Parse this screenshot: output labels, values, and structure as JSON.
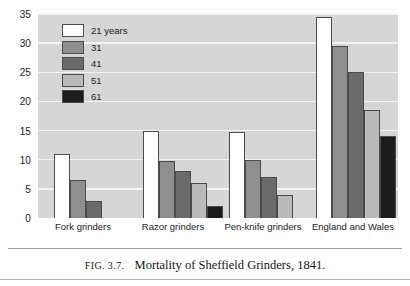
{
  "caption": {
    "figure_number": "FIG. 3.7.",
    "text": "Mortality of Sheffield Grinders, 1841."
  },
  "chart_data": {
    "type": "bar",
    "title": "Mortality of Sheffield Grinders, 1841.",
    "xlabel": "",
    "ylabel": "",
    "ylim": [
      0,
      35
    ],
    "yticks": [
      0,
      5,
      10,
      15,
      20,
      25,
      30,
      35
    ],
    "grid": true,
    "legend_position": "top-left inside plot",
    "categories": [
      "Fork grinders",
      "Razor grinders",
      "Pen-knife grinders",
      "England and Wales"
    ],
    "series": [
      {
        "name": "21 years",
        "color": "#ffffff",
        "values": [
          11,
          15,
          14.7,
          34.5
        ]
      },
      {
        "name": "31",
        "color": "#8f8f8f",
        "values": [
          6.5,
          9.7,
          10,
          29.5
        ]
      },
      {
        "name": "41",
        "color": "#6b6b6b",
        "values": [
          3,
          8,
          7,
          25
        ]
      },
      {
        "name": "51",
        "color": "#bababa",
        "values": [
          null,
          6,
          4,
          18.5
        ]
      },
      {
        "name": "61",
        "color": "#1c1c1c",
        "values": [
          null,
          2,
          null,
          14
        ]
      }
    ]
  }
}
